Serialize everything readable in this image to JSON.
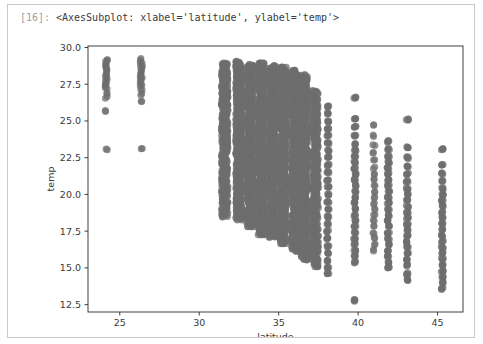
{
  "cell": {
    "prompt_label": "[16]:",
    "output_repr": "<AxesSubplot: xlabel='latitude', ylabel='temp'>"
  },
  "colors": {
    "marker": "#6e6e6e",
    "axis": "#2b2b2b",
    "text": "#3a3a3a",
    "prompt": "#a0a0a0",
    "cell_border": "#c9c9c9",
    "background": "#ffffff"
  },
  "chart_data": {
    "type": "scatter",
    "title": "",
    "xlabel": "latitude",
    "ylabel": "temp",
    "xlim": [
      23.0,
      46.6
    ],
    "ylim": [
      12.0,
      30.1
    ],
    "xticks": [
      25,
      30,
      35,
      40,
      45
    ],
    "xticklabels": [
      "25",
      "30",
      "35",
      "40",
      "45"
    ],
    "yticks": [
      12.5,
      15.0,
      17.5,
      20.0,
      22.5,
      25.0,
      27.5,
      30.0
    ],
    "yticklabels": [
      "12.5",
      "15.0",
      "17.5",
      "20.0",
      "22.5",
      "25.0",
      "27.5",
      "30.0"
    ],
    "grid": false,
    "legend": null,
    "marker_color": "#6e6e6e",
    "marker_alpha": 0.72,
    "marker_size": 4.6,
    "note": "Temperature vs latitude for weather stations; observations fall into discrete latitude columns.",
    "columns": [
      {
        "x": 24.15,
        "values": [
          29.2,
          29.0,
          28.8,
          28.6,
          28.4,
          28.2,
          28.0,
          27.8,
          27.6,
          27.4,
          27.2,
          26.9,
          26.6,
          25.7,
          23.1
        ]
      },
      {
        "x": 26.35,
        "values": [
          29.2,
          29.0,
          28.8,
          28.6,
          28.4,
          28.2,
          28.0,
          27.8,
          27.6,
          27.4,
          27.1,
          26.8,
          26.3,
          23.1
        ]
      },
      {
        "x": 31.6,
        "values": [
          28.8,
          28.5,
          28.2,
          27.8,
          27.4,
          27.0,
          26.6,
          26.3,
          26.0,
          25.7,
          25.4,
          25.1,
          24.8,
          24.5,
          24.2,
          23.9,
          23.6,
          23.3,
          23.0,
          22.6,
          22.2,
          21.8,
          21.4,
          21.0,
          20.6,
          20.2,
          19.8,
          19.4,
          19.0,
          18.6
        ]
      },
      {
        "x": 32.5,
        "values": [
          28.9,
          28.6,
          28.3,
          28.0,
          27.7,
          27.4,
          27.1,
          26.8,
          26.5,
          26.2,
          25.9,
          25.6,
          25.3,
          25.0,
          24.7,
          24.4,
          24.1,
          23.8,
          23.5,
          23.2,
          22.9,
          22.6,
          22.3,
          22.0,
          21.7,
          21.4,
          21.1,
          20.8,
          20.5,
          20.2,
          19.9,
          19.6,
          19.3,
          19.0,
          18.7,
          18.4
        ]
      },
      {
        "x": 33.2,
        "values": [
          28.7,
          28.4,
          28.1,
          27.8,
          27.5,
          27.2,
          26.9,
          26.6,
          26.3,
          26.0,
          25.7,
          25.4,
          25.1,
          24.8,
          24.5,
          24.2,
          23.9,
          23.6,
          23.3,
          23.0,
          22.7,
          22.4,
          22.1,
          21.8,
          21.5,
          21.2,
          20.9,
          20.6,
          20.3,
          20.0,
          19.7,
          19.4,
          19.1,
          18.8,
          18.5,
          18.2,
          17.9
        ]
      },
      {
        "x": 33.9,
        "values": [
          28.8,
          28.5,
          28.2,
          27.9,
          27.6,
          27.3,
          27.0,
          26.7,
          26.4,
          26.1,
          25.8,
          25.5,
          25.2,
          24.9,
          24.6,
          24.3,
          24.0,
          23.7,
          23.4,
          23.1,
          22.8,
          22.5,
          22.2,
          21.9,
          21.6,
          21.3,
          21.0,
          20.7,
          20.4,
          20.1,
          19.8,
          19.5,
          19.2,
          18.9,
          18.6,
          18.3,
          18.0,
          17.7,
          17.4
        ]
      },
      {
        "x": 34.6,
        "values": [
          28.6,
          28.3,
          28.0,
          27.7,
          27.4,
          27.1,
          26.8,
          26.5,
          26.2,
          25.9,
          25.6,
          25.3,
          25.0,
          24.7,
          24.4,
          24.1,
          23.8,
          23.5,
          23.2,
          22.9,
          22.6,
          22.3,
          22.0,
          21.7,
          21.4,
          21.1,
          20.8,
          20.5,
          20.2,
          19.9,
          19.6,
          19.3,
          19.0,
          18.7,
          18.4,
          18.1,
          17.8,
          17.5,
          17.2
        ]
      },
      {
        "x": 35.3,
        "values": [
          28.5,
          28.2,
          27.9,
          27.6,
          27.3,
          27.0,
          26.7,
          26.4,
          26.1,
          25.8,
          25.5,
          25.2,
          24.9,
          24.6,
          24.3,
          24.0,
          23.7,
          23.4,
          23.1,
          22.8,
          22.5,
          22.2,
          21.9,
          21.6,
          21.3,
          21.0,
          20.7,
          20.4,
          20.1,
          19.8,
          19.5,
          19.2,
          18.9,
          18.6,
          18.3,
          18.0,
          17.7,
          17.4,
          17.1,
          16.8
        ]
      },
      {
        "x": 36.0,
        "values": [
          28.3,
          28.0,
          27.7,
          27.4,
          27.1,
          26.8,
          26.5,
          26.2,
          25.9,
          25.6,
          25.3,
          25.0,
          24.7,
          24.4,
          24.1,
          23.8,
          23.5,
          23.2,
          22.9,
          22.6,
          22.3,
          22.0,
          21.7,
          21.4,
          21.1,
          20.8,
          20.5,
          20.2,
          19.9,
          19.6,
          19.3,
          19.0,
          18.7,
          18.4,
          18.1,
          17.8,
          17.5,
          17.2,
          16.9,
          16.6,
          16.3
        ]
      },
      {
        "x": 36.6,
        "values": [
          28.0,
          27.7,
          27.4,
          27.1,
          26.8,
          26.5,
          26.2,
          25.9,
          25.6,
          25.3,
          25.0,
          24.7,
          24.4,
          24.1,
          23.8,
          23.5,
          23.2,
          22.9,
          22.6,
          22.3,
          22.0,
          21.7,
          21.4,
          21.1,
          20.8,
          20.5,
          20.2,
          19.9,
          19.6,
          19.3,
          19.0,
          18.7,
          18.4,
          18.1,
          17.8,
          17.5,
          17.2,
          16.9,
          16.6,
          16.3,
          16.0,
          15.7
        ]
      },
      {
        "x": 37.3,
        "values": [
          26.9,
          26.4,
          26.0,
          25.6,
          25.2,
          24.8,
          24.4,
          24.0,
          23.6,
          23.2,
          22.8,
          22.4,
          22.0,
          21.6,
          21.2,
          20.8,
          20.4,
          20.0,
          19.6,
          19.2,
          18.8,
          18.4,
          18.0,
          17.6,
          17.2,
          16.8,
          16.4,
          16.0,
          15.6,
          15.2
        ]
      },
      {
        "x": 38.1,
        "values": [
          26.0,
          25.5,
          25.0,
          24.5,
          24.0,
          23.5,
          23.0,
          22.5,
          22.0,
          21.5,
          21.0,
          20.5,
          20.0,
          19.5,
          19.0,
          18.5,
          18.0,
          17.5,
          17.0,
          16.5,
          16.0,
          15.5,
          15.0,
          14.6
        ]
      },
      {
        "x": 39.8,
        "values": [
          26.6,
          25.2,
          24.6,
          24.0,
          23.4,
          23.0,
          22.6,
          22.2,
          21.8,
          21.4,
          21.0,
          20.6,
          20.2,
          19.8,
          19.4,
          19.0,
          18.6,
          18.2,
          17.8,
          17.4,
          17.0,
          16.6,
          16.2,
          15.8,
          15.4,
          12.8
        ]
      },
      {
        "x": 41.0,
        "values": [
          24.7,
          24.0,
          23.4,
          22.8,
          22.3,
          21.8,
          21.4,
          21.0,
          20.6,
          20.2,
          19.8,
          19.4,
          19.0,
          18.6,
          18.2,
          17.8,
          17.4,
          17.0,
          16.6,
          16.2
        ]
      },
      {
        "x": 41.9,
        "values": [
          23.6,
          23.1,
          22.6,
          22.2,
          21.8,
          21.4,
          21.0,
          20.6,
          20.2,
          19.8,
          19.4,
          19.0,
          18.6,
          18.2,
          17.8,
          17.4,
          17.0,
          16.6,
          16.2,
          15.8,
          15.4,
          15.0
        ]
      },
      {
        "x": 43.1,
        "values": [
          25.1,
          23.2,
          22.5,
          21.9,
          21.4,
          20.9,
          20.4,
          20.0,
          19.6,
          19.2,
          18.8,
          18.4,
          18.0,
          17.6,
          17.2,
          16.8,
          16.4,
          16.0,
          15.6,
          15.2,
          14.6,
          14.2
        ]
      },
      {
        "x": 45.3,
        "values": [
          23.1,
          22.0,
          21.4,
          20.9,
          20.4,
          20.0,
          19.6,
          19.2,
          18.8,
          18.4,
          18.0,
          17.6,
          17.2,
          16.8,
          16.4,
          16.0,
          15.6,
          15.2,
          14.8,
          14.4,
          14.0,
          13.6
        ]
      }
    ]
  }
}
